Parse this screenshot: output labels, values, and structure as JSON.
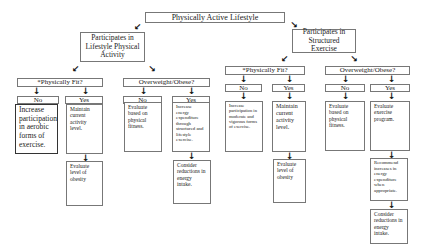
{
  "root": {
    "label": "Physically Active Lifestyle"
  },
  "branches": [
    {
      "label": "Participates in Lifestyle Physical Activity",
      "fit": {
        "question": "*Physically Fit?",
        "no": "No",
        "yes": "Yes",
        "no_action": "Increase participation in aerobic forms of exercise.",
        "yes_action": "Maintain current activity level.",
        "yes_followup": "Evaluate level of obesity"
      },
      "overweight": {
        "question": "Overweight/Obese?",
        "no": "No",
        "yes": "Yes",
        "no_action": "Evaluate based on physical fitness.",
        "yes_action": "Increase energy expenditure through structured and lifestyle exercise.",
        "yes_followup": "Consider reductions in energy intake."
      }
    },
    {
      "label": "Participates in Structured Exercise",
      "fit": {
        "question": "*Physically Fit?",
        "no": "No",
        "yes": "Yes",
        "no_action": "Increase participation in moderate and vigorous forms of exercise.",
        "yes_action": "Maintain current activity level.",
        "yes_followup": "Evaluate level of obesity"
      },
      "overweight": {
        "question": "Overweight/Obese?",
        "no": "No",
        "yes": "Yes",
        "no_action": "Evaluate based on physical fitness.",
        "yes_action": "Evaluate exercise program.",
        "yes_followup": "Recommend increases in energy expenditure when appropriate.",
        "yes_followup2": "Consider reductions in energy intake."
      }
    }
  ],
  "arrows": {
    "down": "🡇",
    "down_left": "🡇",
    "down_right": "🡇"
  }
}
